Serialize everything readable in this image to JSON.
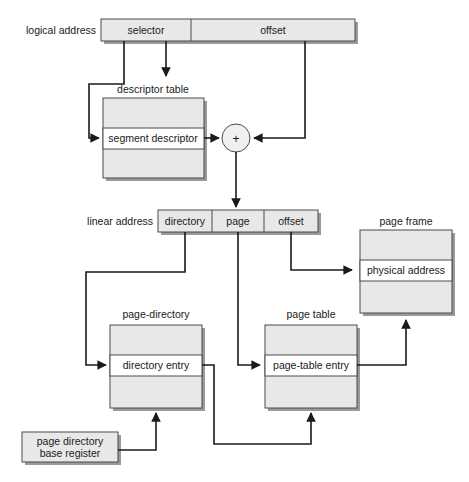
{
  "diagram": {
    "colors": {
      "box_fill": "#e8e8e8",
      "box_stroke": "#4a4a4a",
      "line": "#1a1a1a",
      "shadow": "#9a9a9a",
      "background": "#ffffff"
    },
    "labels": {
      "logical_address": "logical address",
      "selector": "selector",
      "offset_logical": "offset",
      "descriptor_table": "descriptor table",
      "segment_descriptor": "segment descriptor",
      "adder": "+",
      "linear_address": "linear address",
      "directory": "directory",
      "page": "page",
      "offset_linear": "offset",
      "page_frame": "page frame",
      "physical_address": "physical address",
      "page_directory": "page-directory",
      "directory_entry": "directory entry",
      "page_table": "page table",
      "page_table_entry": "page-table entry",
      "page_directory_base_register_line1": "page directory",
      "page_directory_base_register_line2": "base register"
    }
  }
}
